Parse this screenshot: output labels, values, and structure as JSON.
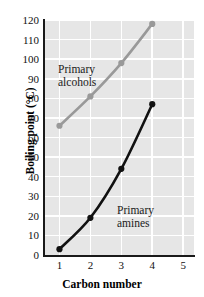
{
  "chart_data": {
    "type": "line",
    "title": "",
    "xlabel": "Carbon number",
    "ylabel": "Boiling point (°C)",
    "xlim": [
      0.5,
      5.35
    ],
    "ylim": [
      0,
      120
    ],
    "xticks": [
      "1",
      "2",
      "3",
      "4",
      "5"
    ],
    "xtick_values": [
      1,
      2,
      3,
      4,
      5
    ],
    "yticks": [
      "0",
      "10",
      "20",
      "30",
      "40",
      "50",
      "60",
      "70",
      "80",
      "90",
      "100",
      "110",
      "120"
    ],
    "ytick_values": [
      0,
      10,
      20,
      30,
      40,
      50,
      60,
      70,
      80,
      90,
      100,
      110,
      120
    ],
    "grid": true,
    "grid_color": "#ffffff",
    "plot_background": "#e6e6e6",
    "legend_position": "inline-annotations",
    "series": [
      {
        "name": "Primary alcohols",
        "color": "#999999",
        "marker": "circle",
        "x": [
          1,
          2,
          3,
          4
        ],
        "values": [
          66,
          81,
          98,
          118
        ]
      },
      {
        "name": "Primary amines",
        "color": "#111111",
        "marker": "circle",
        "x": [
          1,
          2,
          3,
          4
        ],
        "values": [
          3,
          19,
          44,
          77
        ]
      }
    ],
    "annotations": [
      {
        "text_line1": "Primary",
        "text_line2": "alcohols",
        "series": "Primary alcohols"
      },
      {
        "text_line1": "Primary",
        "text_line2": "amines",
        "series": "Primary amines"
      }
    ]
  },
  "labels": {
    "y_axis_title": "Boiling point (°C)",
    "x_axis_title": "Carbon number",
    "alcohols_line1": "Primary",
    "alcohols_line2": "alcohols",
    "amines_line1": "Primary",
    "amines_line2": "amines"
  }
}
